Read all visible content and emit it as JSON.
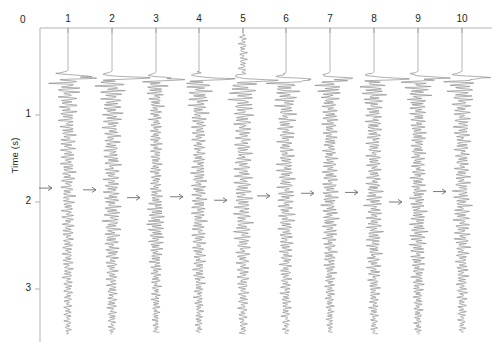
{
  "figure": {
    "title": "",
    "ylabel": "Time (s)",
    "zero_label": "0",
    "caption": ""
  },
  "axis": {
    "y_ticks": [
      "1",
      "2",
      "3"
    ],
    "y_tick_values": [
      1,
      2,
      3
    ],
    "top_axis_label": "0",
    "time_origin": 0,
    "time_max": 3.6
  },
  "trace_labels": [
    "1",
    "2",
    "3",
    "4",
    "5",
    "6",
    "7",
    "8",
    "9",
    "10"
  ],
  "colors": {
    "trace": "#8c8c8c",
    "axis": "#b3b3b3",
    "text": "#231f20",
    "background": "#ffffff",
    "arrow": "#6e6e6e"
  },
  "chart_data": {
    "type": "line",
    "title": "",
    "xlabel": "",
    "ylabel": "Time (s)",
    "ylim": [
      0,
      3.6
    ],
    "xlim": [
      0.5,
      10.5
    ],
    "grid": false,
    "legend": null,
    "orientation": "vertical-traces-time-down",
    "categories": [
      "1",
      "2",
      "3",
      "4",
      "5",
      "6",
      "7",
      "8",
      "9",
      "10"
    ],
    "x_positions": [
      68,
      112,
      156,
      199,
      243,
      286,
      330,
      374,
      418,
      462
    ],
    "y_axis_pixels": {
      "t0": 28,
      "per_second": 87
    },
    "series": [
      {
        "name": "1",
        "trace_index": 1,
        "first_break_s": 0.56,
        "first_break_amp": 1.0,
        "arrow_time_s": 1.84,
        "noise_start_s": 0.52,
        "end_s": 3.52,
        "dominant_freq_hz": 26,
        "envelope": [
          [
            0.56,
            1.0
          ],
          [
            0.75,
            0.55
          ],
          [
            1.1,
            0.42
          ],
          [
            1.6,
            0.4
          ],
          [
            2.0,
            0.34
          ],
          [
            2.5,
            0.3
          ],
          [
            3.0,
            0.26
          ],
          [
            3.5,
            0.18
          ]
        ]
      },
      {
        "name": "2",
        "trace_index": 2,
        "first_break_s": 0.57,
        "first_break_amp": 1.0,
        "arrow_time_s": 1.86,
        "noise_start_s": 0.53,
        "end_s": 3.52,
        "dominant_freq_hz": 27,
        "envelope": [
          [
            0.57,
            1.0
          ],
          [
            0.8,
            0.58
          ],
          [
            1.2,
            0.45
          ],
          [
            1.7,
            0.42
          ],
          [
            2.2,
            0.46
          ],
          [
            2.7,
            0.34
          ],
          [
            3.1,
            0.28
          ],
          [
            3.5,
            0.2
          ]
        ]
      },
      {
        "name": "3",
        "trace_index": 3,
        "first_break_s": 0.58,
        "first_break_amp": 0.72,
        "arrow_time_s": 1.95,
        "noise_start_s": 0.54,
        "end_s": 3.5,
        "dominant_freq_hz": 30,
        "envelope": [
          [
            0.58,
            0.72
          ],
          [
            0.85,
            0.36
          ],
          [
            1.3,
            0.3
          ],
          [
            1.8,
            0.3
          ],
          [
            2.25,
            0.5
          ],
          [
            2.7,
            0.3
          ],
          [
            3.1,
            0.24
          ],
          [
            3.5,
            0.16
          ]
        ]
      },
      {
        "name": "4",
        "trace_index": 4,
        "first_break_s": 0.58,
        "first_break_amp": 0.78,
        "arrow_time_s": 1.94,
        "noise_start_s": 0.5,
        "end_s": 3.5,
        "dominant_freq_hz": 28,
        "envelope": [
          [
            0.58,
            0.78
          ],
          [
            0.9,
            0.46
          ],
          [
            1.35,
            0.34
          ],
          [
            1.85,
            0.42
          ],
          [
            2.3,
            0.38
          ],
          [
            2.8,
            0.3
          ],
          [
            3.2,
            0.24
          ],
          [
            3.5,
            0.18
          ]
        ]
      },
      {
        "name": "5",
        "trace_index": 5,
        "first_break_s": 0.6,
        "first_break_amp": 1.0,
        "arrow_time_s": 1.98,
        "noise_start_s": 0.08,
        "end_s": 3.52,
        "dominant_freq_hz": 25,
        "envelope": [
          [
            0.6,
            1.0
          ],
          [
            0.9,
            0.52
          ],
          [
            1.4,
            0.44
          ],
          [
            1.9,
            0.5
          ],
          [
            2.35,
            0.44
          ],
          [
            2.8,
            0.34
          ],
          [
            3.2,
            0.26
          ],
          [
            3.5,
            0.2
          ]
        ]
      },
      {
        "name": "6",
        "trace_index": 6,
        "first_break_s": 0.59,
        "first_break_amp": 0.92,
        "arrow_time_s": 1.93,
        "noise_start_s": 0.52,
        "end_s": 3.52,
        "dominant_freq_hz": 27,
        "envelope": [
          [
            0.59,
            0.92
          ],
          [
            0.9,
            0.5
          ],
          [
            1.4,
            0.42
          ],
          [
            1.9,
            0.46
          ],
          [
            2.35,
            0.4
          ],
          [
            2.8,
            0.32
          ],
          [
            3.2,
            0.26
          ],
          [
            3.5,
            0.18
          ]
        ]
      },
      {
        "name": "7",
        "trace_index": 7,
        "first_break_s": 0.58,
        "first_break_amp": 0.85,
        "arrow_time_s": 1.9,
        "noise_start_s": 0.53,
        "end_s": 3.5,
        "dominant_freq_hz": 29,
        "envelope": [
          [
            0.58,
            0.85
          ],
          [
            0.88,
            0.44
          ],
          [
            1.35,
            0.36
          ],
          [
            1.85,
            0.44
          ],
          [
            2.3,
            0.42
          ],
          [
            2.75,
            0.3
          ],
          [
            3.15,
            0.24
          ],
          [
            3.5,
            0.16
          ]
        ]
      },
      {
        "name": "8",
        "trace_index": 8,
        "first_break_s": 0.58,
        "first_break_amp": 0.88,
        "arrow_time_s": 1.89,
        "noise_start_s": 0.52,
        "end_s": 3.52,
        "dominant_freq_hz": 28,
        "envelope": [
          [
            0.58,
            0.88
          ],
          [
            0.9,
            0.48
          ],
          [
            1.4,
            0.38
          ],
          [
            1.9,
            0.46
          ],
          [
            2.35,
            0.44
          ],
          [
            2.8,
            0.34
          ],
          [
            3.2,
            0.26
          ],
          [
            3.5,
            0.18
          ]
        ]
      },
      {
        "name": "9",
        "trace_index": 9,
        "first_break_s": 0.57,
        "first_break_amp": 0.86,
        "arrow_time_s": 2.0,
        "noise_start_s": 0.52,
        "end_s": 3.52,
        "dominant_freq_hz": 30,
        "envelope": [
          [
            0.57,
            0.86
          ],
          [
            0.9,
            0.46
          ],
          [
            1.4,
            0.38
          ],
          [
            1.9,
            0.4
          ],
          [
            2.35,
            0.46
          ],
          [
            2.8,
            0.34
          ],
          [
            3.2,
            0.26
          ],
          [
            3.5,
            0.18
          ]
        ]
      },
      {
        "name": "10",
        "trace_index": 10,
        "first_break_s": 0.57,
        "first_break_amp": 0.9,
        "arrow_time_s": 1.88,
        "noise_start_s": 0.52,
        "end_s": 3.5,
        "dominant_freq_hz": 27,
        "envelope": [
          [
            0.57,
            0.9
          ],
          [
            0.9,
            0.5
          ],
          [
            1.4,
            0.4
          ],
          [
            1.9,
            0.44
          ],
          [
            2.35,
            0.42
          ],
          [
            2.8,
            0.32
          ],
          [
            3.2,
            0.26
          ],
          [
            3.5,
            0.18
          ]
        ]
      }
    ],
    "annotations": [
      {
        "type": "arrow",
        "text": "→",
        "trace": "1",
        "time_s": 1.84
      },
      {
        "type": "arrow",
        "text": "→",
        "trace": "2",
        "time_s": 1.86
      },
      {
        "type": "arrow",
        "text": "→",
        "trace": "3",
        "time_s": 1.95
      },
      {
        "type": "arrow",
        "text": "→",
        "trace": "4",
        "time_s": 1.94
      },
      {
        "type": "arrow",
        "text": "→",
        "trace": "5",
        "time_s": 1.98
      },
      {
        "type": "arrow",
        "text": "→",
        "trace": "6",
        "time_s": 1.93
      },
      {
        "type": "arrow",
        "text": "→",
        "trace": "7",
        "time_s": 1.9
      },
      {
        "type": "arrow",
        "text": "→",
        "trace": "8",
        "time_s": 1.89
      },
      {
        "type": "arrow",
        "text": "→",
        "trace": "9",
        "time_s": 2.0
      },
      {
        "type": "arrow",
        "text": "→",
        "trace": "10",
        "time_s": 1.88
      }
    ]
  }
}
